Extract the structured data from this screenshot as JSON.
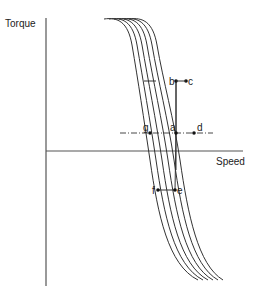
{
  "axes": {
    "y_label": "Torque",
    "x_label": "Speed"
  },
  "curves": {
    "count": 6,
    "color": "#333333"
  },
  "reference_line": {
    "style": "dash-dot",
    "level": "a"
  },
  "points": [
    {
      "id": "b",
      "label": "b"
    },
    {
      "id": "c",
      "label": "c"
    },
    {
      "id": "g",
      "label": "g"
    },
    {
      "id": "a",
      "label": "a"
    },
    {
      "id": "d",
      "label": "d"
    },
    {
      "id": "f",
      "label": "f"
    },
    {
      "id": "e",
      "label": "e"
    }
  ]
}
